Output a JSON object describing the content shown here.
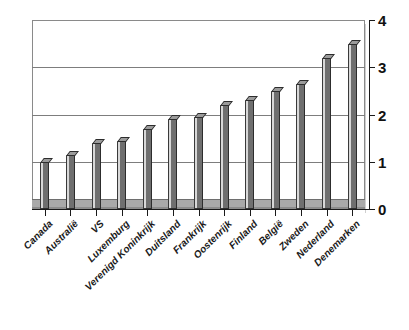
{
  "chart_data": {
    "type": "bar",
    "title": "",
    "subtitle": "",
    "xlabel": "",
    "ylabel": "",
    "ylim": [
      0,
      4
    ],
    "yticks": [
      0,
      1,
      2,
      3,
      4
    ],
    "ytick_labels": [
      "0",
      "1",
      "2",
      "3",
      "4"
    ],
    "grid": true,
    "grid_axis": "y",
    "legend": false,
    "legend_position": "none",
    "y_axis_position": "right",
    "x_label_rotation": -45,
    "bar_style": "3d-column",
    "categories": [
      "Canada",
      "Australië",
      "VS",
      "Luxemburg",
      "Verenigd Koninkrijk",
      "Duitsland",
      "Frankrijk",
      "Oostenrijk",
      "Finland",
      "België",
      "Zweden",
      "Nederland",
      "Denemarken"
    ],
    "values": [
      1.0,
      1.15,
      1.4,
      1.45,
      1.7,
      1.9,
      1.95,
      2.2,
      2.3,
      2.5,
      2.65,
      3.2,
      3.5
    ],
    "series": [
      {
        "name": "",
        "values": [
          1.0,
          1.15,
          1.4,
          1.45,
          1.7,
          1.9,
          1.95,
          2.2,
          2.3,
          2.5,
          2.65,
          3.2,
          3.5
        ]
      }
    ]
  },
  "colors": {
    "bar_front": "#6f6f6f",
    "bar_left": "#d8d8d8",
    "bar_top": "#9b9b9b",
    "bar_outline": "#2d2d2d",
    "gridline": "#7d7d7d",
    "axis": "#1a1a1a",
    "frame": "#8a8a8a",
    "floor": "#a9a9a9",
    "background": "#ffffff",
    "label_text": "#1a1a1a"
  }
}
